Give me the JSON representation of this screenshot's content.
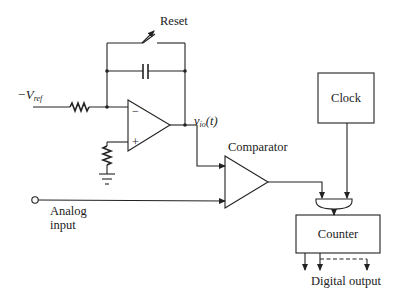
{
  "diagram": {
    "labels": {
      "reset": "Reset",
      "vref_prefix": "−V",
      "vref_sub": "ref",
      "vio_main": "v",
      "vio_sub": "io",
      "vio_suffix": "(t)",
      "comparator": "Comparator",
      "analog_input_line1": "Analog",
      "analog_input_line2": "input",
      "clock": "Clock",
      "counter": "Counter",
      "digital_output": "Digital output",
      "opamp_minus": "−",
      "opamp_plus": "+"
    },
    "components": [
      "resistor",
      "switch",
      "capacitor",
      "op-amp integrator",
      "resistor to ground",
      "ground",
      "comparator",
      "AND gate",
      "clock",
      "counter"
    ]
  }
}
